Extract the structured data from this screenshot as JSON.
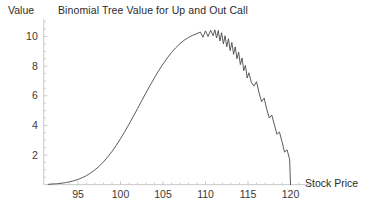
{
  "chart_data": {
    "type": "line",
    "title": "Binomial Tree Value for Up and Out Call",
    "xlabel": "Stock Price",
    "ylabel": "Value",
    "xlim": [
      91.5,
      121.5
    ],
    "ylim": [
      0,
      11.2
    ],
    "xticks": [
      95,
      100,
      105,
      110,
      115,
      120
    ],
    "xtick_labels": [
      "95",
      "100",
      "105",
      "110",
      "115",
      "120"
    ],
    "yticks": [
      2,
      4,
      6,
      8,
      10
    ],
    "ytick_labels": [
      "2",
      "4",
      "6",
      "8",
      "10"
    ],
    "grid": false,
    "legend": null,
    "line_color": "#4a4a4a",
    "axis_color": "#bdbdbd",
    "series": [
      {
        "name": "Binomial tree value",
        "x": [
          91.5,
          92.0,
          92.5,
          93.0,
          93.5,
          94.0,
          94.5,
          95.0,
          95.5,
          96.0,
          96.5,
          97.0,
          97.5,
          98.0,
          98.5,
          99.0,
          99.5,
          100.0,
          100.5,
          101.0,
          101.5,
          102.0,
          102.5,
          103.0,
          103.5,
          104.0,
          104.5,
          105.0,
          105.5,
          106.0,
          106.5,
          107.0,
          107.5,
          108.0,
          108.5,
          109.0,
          109.4,
          109.7,
          110.0,
          110.3,
          110.6,
          110.9,
          111.1,
          111.3,
          111.5,
          111.7,
          111.9,
          112.1,
          112.3,
          112.5,
          112.7,
          112.9,
          113.1,
          113.3,
          113.5,
          113.7,
          113.9,
          114.1,
          114.3,
          114.5,
          114.7,
          114.9,
          115.1,
          115.4,
          115.7,
          116.0,
          116.3,
          116.6,
          116.9,
          117.2,
          117.5,
          117.8,
          118.1,
          118.4,
          118.7,
          119.0,
          119.3,
          119.6,
          119.9,
          120.0
        ],
        "y": [
          0.02,
          0.04,
          0.06,
          0.09,
          0.13,
          0.19,
          0.26,
          0.35,
          0.47,
          0.61,
          0.79,
          1.0,
          1.25,
          1.54,
          1.87,
          2.24,
          2.65,
          3.1,
          3.58,
          4.08,
          4.6,
          5.13,
          5.67,
          6.2,
          6.72,
          7.22,
          7.7,
          8.14,
          8.55,
          8.92,
          9.24,
          9.52,
          9.75,
          9.94,
          10.08,
          10.2,
          10.3,
          9.95,
          10.38,
          10.0,
          10.42,
          10.05,
          10.45,
          9.9,
          10.4,
          9.7,
          10.25,
          9.5,
          10.05,
          9.3,
          9.85,
          9.05,
          9.6,
          8.8,
          9.3,
          8.5,
          8.95,
          8.1,
          8.55,
          7.7,
          8.05,
          7.2,
          7.55,
          6.9,
          6.65,
          6.95,
          6.2,
          5.6,
          5.85,
          5.1,
          4.5,
          4.7,
          4.05,
          3.4,
          3.55,
          2.9,
          2.2,
          2.35,
          1.7,
          0.0
        ]
      }
    ]
  },
  "labels": {
    "title": "Binomial Tree Value for Up and Out Call",
    "y_axis_name": "Value",
    "x_axis_name": "Stock Price"
  },
  "xticks": [
    {
      "value": "95",
      "px": 78
    },
    {
      "value": "100",
      "px": 120.5
    },
    {
      "value": "105",
      "px": 163
    },
    {
      "value": "110",
      "px": 205.5
    },
    {
      "value": "115",
      "px": 248
    },
    {
      "value": "120",
      "px": 290.5
    }
  ],
  "yticks": [
    {
      "value": "2",
      "px": 155
    },
    {
      "value": "4",
      "px": 125
    },
    {
      "value": "6",
      "px": 95.5
    },
    {
      "value": "8",
      "px": 66
    },
    {
      "value": "10",
      "px": 36.5
    }
  ],
  "colors": {
    "curve": "#4a4a4a",
    "axis": "#bdbdbd",
    "tick_text": "#3a3a3a",
    "title_text": "#2b2b2b",
    "background": "#ffffff"
  }
}
